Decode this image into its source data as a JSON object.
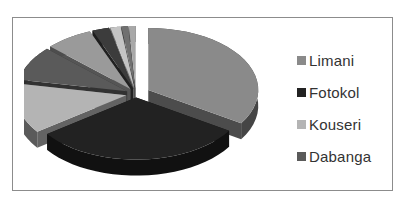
{
  "chart_data": {
    "type": "pie",
    "style": "3d-exploded",
    "title": "",
    "categories": [
      "Limani",
      "Fotokol",
      "Kouseri",
      "Dabanga",
      "Other 5",
      "Other 6",
      "Other 7",
      "Other 8",
      "Other 9"
    ],
    "values": [
      34,
      31,
      13,
      9,
      7,
      2.5,
      1.5,
      1,
      1
    ],
    "colors": [
      "#8a8a8a",
      "#222222",
      "#b4b4b4",
      "#5a5a5a",
      "#9a9a9a",
      "#3c3c3c",
      "#c4c4c4",
      "#707070",
      "#a8a8a8"
    ],
    "legend_position": "right",
    "legend_entries_visible": [
      "Limani",
      "Fotokol",
      "Kouseri",
      "Dabanga"
    ]
  },
  "legend": {
    "items": [
      {
        "label": "Limani",
        "color": "#8a8a8a"
      },
      {
        "label": "Fotokol",
        "color": "#222222"
      },
      {
        "label": "Kouseri",
        "color": "#b4b4b4"
      },
      {
        "label": "Dabanga",
        "color": "#5a5a5a"
      }
    ]
  }
}
